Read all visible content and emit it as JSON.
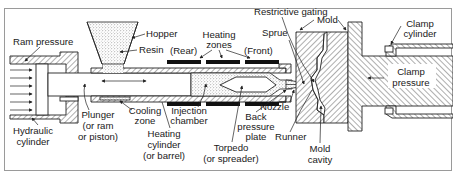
{
  "diagram": {
    "type": "cross-section schematic",
    "frame_color": "#9a9a9a",
    "line_color": "#222222",
    "heater_color": "#111111",
    "labels": {
      "ram_pressure": "Ram pressure",
      "hydraulic_cylinder_l1": "Hydraulic",
      "hydraulic_cylinder_l2": "cylinder",
      "hopper": "Hopper",
      "resin": "Resin",
      "plunger_l1": "Plunger",
      "plunger_l2": "(or ram",
      "plunger_l3": "or piston)",
      "cooling_zone_l1": "Cooling",
      "cooling_zone_l2": "zone",
      "heating_cylinder_l1": "Heating",
      "heating_cylinder_l2": "cylinder",
      "heating_cylinder_l3": "(or barrel)",
      "injection_chamber_l1": "Injection",
      "injection_chamber_l2": "chamber",
      "heating_zones_l1": "Heating",
      "heating_zones_l2": "zones",
      "rear": "(Rear)",
      "front": "(Front)",
      "torpedo_l1": "Torpedo",
      "torpedo_l2": "(or spreader)",
      "back_pressure_plate_l1": "Back",
      "back_pressure_plate_l2": "pressure",
      "back_pressure_plate_l3": "plate",
      "nozzle": "Nozzle",
      "sprue": "Sprue",
      "restrictive_gating": "Restrictive gating",
      "mold": "Mold",
      "runner": "Runner",
      "mold_cavity_l1": "Mold",
      "mold_cavity_l2": "cavity",
      "clamp_cylinder_l1": "Clamp",
      "clamp_cylinder_l2": "cylinder",
      "clamp_pressure_l1": "Clamp",
      "clamp_pressure_l2": "pressure"
    }
  }
}
